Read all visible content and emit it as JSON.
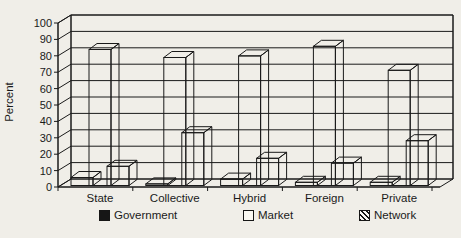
{
  "chart_data": {
    "type": "bar",
    "style": "3d-clustered",
    "title": "",
    "xlabel": "",
    "ylabel": "Percent",
    "ylim": [
      0,
      100
    ],
    "ytick_step": 10,
    "yticks": [
      0,
      10,
      20,
      30,
      40,
      50,
      60,
      70,
      80,
      90,
      100
    ],
    "grid": true,
    "legend_position": "bottom",
    "categories": [
      "State",
      "Collective",
      "Hybrid",
      "Foreign",
      "Private"
    ],
    "series": [
      {
        "name": "Government",
        "fill": "black",
        "values": [
          5,
          1,
          4,
          2,
          2
        ]
      },
      {
        "name": "Market",
        "fill": "white",
        "values": [
          85,
          80,
          81,
          87,
          72
        ]
      },
      {
        "name": "Network",
        "fill": "hatched",
        "values": [
          12,
          33,
          17,
          14,
          28
        ]
      }
    ]
  },
  "colors": {
    "background": "#f0eee8",
    "line": "#1a1a1a",
    "bar_black": "#161616",
    "bar_white_front": "#faf8f2",
    "bar_white_side": "#a5a29a",
    "bar_white_top": "#eceae3",
    "hatch_side_bg": "#d9d6ce"
  },
  "legend": {
    "government_label": "Government",
    "market_label": "Market",
    "network_label": "Network"
  }
}
